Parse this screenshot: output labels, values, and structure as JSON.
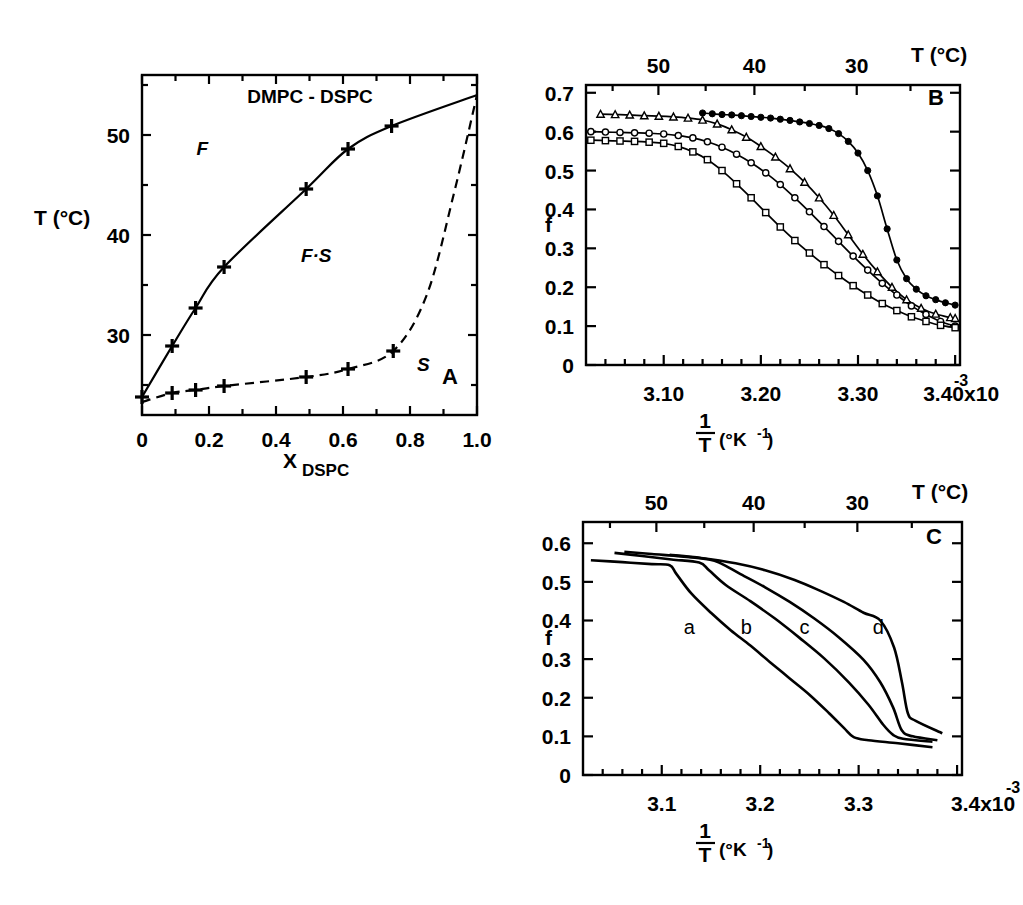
{
  "figure": {
    "panels": [
      "A",
      "B",
      "C"
    ],
    "background": "#ffffff",
    "ink": "#000000"
  },
  "panelA": {
    "letter": "A",
    "title": "DMPC - DSPC",
    "xlabel_main": "X",
    "xlabel_sub": "DSPC",
    "ylabel": "T (°C)",
    "xticks": [
      "0",
      "0.2",
      "0.4",
      "0.6",
      "0.8",
      "1.0"
    ],
    "yticks": [
      "30",
      "40",
      "50"
    ],
    "regions": [
      {
        "label": "F",
        "x": 0.18,
        "y": 48.0
      },
      {
        "label": "F·S",
        "x": 0.52,
        "y": 37.3
      },
      {
        "label": "S",
        "x": 0.84,
        "y": 26.4
      }
    ],
    "chart_data": {
      "type": "line",
      "title": "DMPC - DSPC phase diagram",
      "xlabel": "X_DSPC",
      "ylabel": "T (°C)",
      "xlim": [
        0,
        1.0
      ],
      "ylim": [
        22.0,
        56.0
      ],
      "grid": false,
      "legend": "none",
      "series": [
        {
          "name": "liquidus (fluidus)",
          "style": "solid-with-plus-markers",
          "x": [
            0.0,
            0.09,
            0.16,
            0.245,
            0.49,
            0.615,
            0.745,
            1.0
          ],
          "y": [
            23.8,
            28.9,
            32.7,
            36.8,
            44.6,
            48.6,
            50.9,
            54.0
          ]
        },
        {
          "name": "solidus",
          "style": "dashed-with-plus-markers",
          "x": [
            0.0,
            0.09,
            0.16,
            0.245,
            0.49,
            0.615,
            0.75,
            0.85,
            0.93,
            1.0
          ],
          "y": [
            23.3,
            24.2,
            24.5,
            24.9,
            25.8,
            26.6,
            28.4,
            34.0,
            44.0,
            54.0
          ]
        }
      ]
    }
  },
  "panelB": {
    "letter": "B",
    "ylabel": "f",
    "top_axis_title": "T  (°C)",
    "top_ticks": [
      "50",
      "40",
      "30"
    ],
    "xticks": [
      "3.10",
      "3.20",
      "3.30",
      "3.40x10"
    ],
    "x_exponent": "-3",
    "xlabel_num": "1",
    "xlabel_den": "T",
    "xlabel_unit": "(°K",
    "xlabel_unit_exp": "-1",
    "xlabel_unit_close": ")",
    "yticks": [
      "0",
      "0.1",
      "0.2",
      "0.3",
      "0.4",
      "0.5",
      "0.6",
      "0.7"
    ],
    "chart_data": {
      "type": "line",
      "title": "",
      "xlabel": "1/T (°K^-1)",
      "ylabel": "f",
      "xlim": [
        0.00302,
        0.003405
      ],
      "ylim": [
        0,
        0.72
      ],
      "top_axis": {
        "label": "T (°C)",
        "ticks_c": [
          50,
          40,
          30
        ]
      },
      "grid": false,
      "legend": "none",
      "series": [
        {
          "name": "curve-1-filled-circles",
          "marker": "filled-circle",
          "x": [
            3.14,
            3.15,
            3.16,
            3.17,
            3.18,
            3.19,
            3.2,
            3.21,
            3.22,
            3.23,
            3.24,
            3.25,
            3.26,
            3.27,
            3.28,
            3.29,
            3.3,
            3.31,
            3.32,
            3.33,
            3.34,
            3.35,
            3.36,
            3.37,
            3.38,
            3.39,
            3.4
          ],
          "y": [
            0.648,
            0.646,
            0.644,
            0.643,
            0.641,
            0.639,
            0.637,
            0.635,
            0.632,
            0.629,
            0.625,
            0.621,
            0.616,
            0.608,
            0.595,
            0.575,
            0.545,
            0.5,
            0.435,
            0.35,
            0.27,
            0.222,
            0.195,
            0.178,
            0.168,
            0.16,
            0.154
          ]
        },
        {
          "name": "curve-2-open-triangles",
          "marker": "open-triangle",
          "x": [
            3.035,
            3.05,
            3.065,
            3.08,
            3.095,
            3.11,
            3.125,
            3.14,
            3.155,
            3.17,
            3.185,
            3.2,
            3.215,
            3.23,
            3.245,
            3.26,
            3.275,
            3.29,
            3.305,
            3.32,
            3.335,
            3.35,
            3.365,
            3.38,
            3.395,
            3.4
          ],
          "y": [
            0.645,
            0.644,
            0.643,
            0.641,
            0.64,
            0.638,
            0.635,
            0.63,
            0.62,
            0.605,
            0.586,
            0.562,
            0.535,
            0.505,
            0.47,
            0.43,
            0.385,
            0.335,
            0.285,
            0.24,
            0.2,
            0.168,
            0.146,
            0.131,
            0.122,
            0.12
          ]
        },
        {
          "name": "curve-3-open-circles",
          "marker": "open-circle",
          "x": [
            3.025,
            3.04,
            3.055,
            3.07,
            3.085,
            3.1,
            3.115,
            3.13,
            3.145,
            3.16,
            3.175,
            3.19,
            3.205,
            3.22,
            3.235,
            3.25,
            3.265,
            3.28,
            3.295,
            3.31,
            3.325,
            3.34,
            3.355,
            3.37,
            3.385,
            3.4
          ],
          "y": [
            0.6,
            0.599,
            0.598,
            0.597,
            0.596,
            0.594,
            0.59,
            0.584,
            0.574,
            0.56,
            0.542,
            0.52,
            0.494,
            0.464,
            0.43,
            0.394,
            0.356,
            0.318,
            0.28,
            0.244,
            0.21,
            0.18,
            0.152,
            0.13,
            0.112,
            0.1
          ]
        },
        {
          "name": "curve-4-open-squares",
          "marker": "open-square",
          "x": [
            3.025,
            3.04,
            3.055,
            3.07,
            3.085,
            3.1,
            3.115,
            3.13,
            3.145,
            3.16,
            3.175,
            3.19,
            3.205,
            3.22,
            3.235,
            3.25,
            3.265,
            3.28,
            3.295,
            3.31,
            3.325,
            3.34,
            3.355,
            3.37,
            3.385,
            3.4
          ],
          "y": [
            0.578,
            0.577,
            0.576,
            0.575,
            0.573,
            0.57,
            0.562,
            0.548,
            0.528,
            0.5,
            0.466,
            0.43,
            0.392,
            0.355,
            0.32,
            0.288,
            0.258,
            0.23,
            0.204,
            0.18,
            0.158,
            0.14,
            0.124,
            0.112,
            0.102,
            0.096
          ]
        }
      ]
    }
  },
  "panelC": {
    "letter": "C",
    "ylabel": "f",
    "top_axis_title": "T (°C)",
    "top_ticks": [
      "50",
      "40",
      "30"
    ],
    "xticks": [
      "3.1",
      "3.2",
      "3.3",
      "3.4x10"
    ],
    "x_exponent": "-3",
    "xlabel_num": "1",
    "xlabel_den": "T",
    "xlabel_unit": "(°K",
    "xlabel_unit_exp": "-1",
    "xlabel_unit_close": ")",
    "yticks": [
      "0",
      "0.1",
      "0.2",
      "0.3",
      "0.4",
      "0.5",
      "0.6"
    ],
    "curve_labels": [
      {
        "label": "a",
        "x": 3.128,
        "y": 0.365
      },
      {
        "label": "b",
        "x": 3.186,
        "y": 0.365
      },
      {
        "label": "c",
        "x": 3.245,
        "y": 0.365
      },
      {
        "label": "d",
        "x": 3.32,
        "y": 0.365
      }
    ],
    "chart_data": {
      "type": "line",
      "title": "",
      "xlabel": "1/T (°K^-1)",
      "ylabel": "f",
      "xlim": [
        0.00302,
        0.003405
      ],
      "ylim": [
        0,
        0.655
      ],
      "top_axis": {
        "label": "T (°C)",
        "ticks_c": [
          50,
          40,
          30
        ]
      },
      "grid": false,
      "legend": "none",
      "series": [
        {
          "name": "a",
          "x": [
            3.028,
            3.06,
            3.09,
            3.108,
            3.115,
            3.13,
            3.15,
            3.17,
            3.19,
            3.21,
            3.23,
            3.25,
            3.27,
            3.285,
            3.295,
            3.31,
            3.34,
            3.375
          ],
          "y": [
            0.556,
            0.551,
            0.546,
            0.543,
            0.52,
            0.47,
            0.42,
            0.375,
            0.335,
            0.292,
            0.25,
            0.208,
            0.16,
            0.122,
            0.098,
            0.09,
            0.082,
            0.072
          ]
        },
        {
          "name": "b",
          "x": [
            3.052,
            3.08,
            3.11,
            3.138,
            3.148,
            3.165,
            3.19,
            3.215,
            3.24,
            3.265,
            3.29,
            3.31,
            3.325,
            3.335,
            3.345,
            3.375
          ],
          "y": [
            0.575,
            0.567,
            0.558,
            0.55,
            0.53,
            0.492,
            0.45,
            0.405,
            0.355,
            0.302,
            0.24,
            0.182,
            0.13,
            0.104,
            0.094,
            0.086
          ]
        },
        {
          "name": "c",
          "x": [
            3.062,
            3.09,
            3.12,
            3.148,
            3.16,
            3.18,
            3.205,
            3.23,
            3.255,
            3.28,
            3.305,
            3.322,
            3.335,
            3.344,
            3.355,
            3.38
          ],
          "y": [
            0.578,
            0.572,
            0.566,
            0.558,
            0.548,
            0.52,
            0.486,
            0.448,
            0.405,
            0.356,
            0.298,
            0.24,
            0.175,
            0.115,
            0.1,
            0.09
          ]
        },
        {
          "name": "d",
          "x": [
            3.108,
            3.14,
            3.175,
            3.205,
            3.235,
            3.26,
            3.285,
            3.305,
            3.322,
            3.336,
            3.344,
            3.35,
            3.358,
            3.385
          ],
          "y": [
            0.57,
            0.562,
            0.548,
            0.53,
            0.505,
            0.478,
            0.448,
            0.42,
            0.4,
            0.33,
            0.24,
            0.16,
            0.14,
            0.108
          ]
        }
      ]
    }
  }
}
